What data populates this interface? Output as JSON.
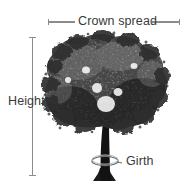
{
  "diagram": {
    "background_color": "#ffffff",
    "label_color": "#3a3a3a",
    "rule_color": "#8c8c8c",
    "tree_color": "#1a1a1a"
  },
  "annotations": {
    "crown_spread": {
      "label": "Crown spread",
      "orientation": "horizontal",
      "icon": "horizontal-measure-rule",
      "line_left": {
        "x1": 48,
        "x2": 75,
        "y": 22
      },
      "line_right": {
        "x1": 152,
        "x2": 180,
        "y": 22
      }
    },
    "height": {
      "label": "Height",
      "orientation": "vertical",
      "icon": "vertical-measure-rule",
      "line": {
        "x": 32,
        "y1": 37,
        "y2": 176
      }
    },
    "girth": {
      "label": "Girth",
      "orientation": "around-trunk",
      "icon": "girth-tape-ellipse",
      "ellipse": {
        "cx": 105,
        "cy": 161,
        "rx": 13,
        "ry": 4.5
      }
    }
  },
  "subject": {
    "name": "deciduous-tree",
    "crown": {
      "left": 46,
      "right": 166,
      "top": 35,
      "bottom": 133
    },
    "trunk": {
      "x": 104,
      "top": 108,
      "bottom": 181
    }
  }
}
